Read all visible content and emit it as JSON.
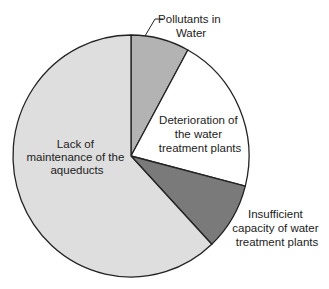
{
  "chart_data": {
    "type": "pie",
    "title": "",
    "start_angle_deg": 0,
    "direction": "clockwise",
    "slices": [
      {
        "label": "Pollutants in Water",
        "value": 8,
        "color": "#b3b3b3"
      },
      {
        "label": "Deterioration of the water treatment plants",
        "value": 21,
        "color": "#ffffff"
      },
      {
        "label": "Insufficient capacity of water treatment plants",
        "value": 9,
        "color": "#7a7a7a"
      },
      {
        "label": "Lack of maintenance of the aqueducts",
        "value": 62,
        "color": "#dedede"
      }
    ],
    "legend": "none",
    "labels_position": "inside/outside with leader line for Pollutants in Water"
  },
  "labels": {
    "pollutants": [
      "Pollutants in",
      "Water"
    ],
    "deterioration": [
      "Deterioration of",
      "the water",
      "treatment plants"
    ],
    "insufficient": [
      "Insufficient",
      "capacity of water",
      "treatment plants"
    ],
    "lack": [
      "Lack of",
      "maintenance of the",
      "aqueducts"
    ]
  }
}
